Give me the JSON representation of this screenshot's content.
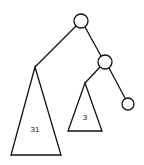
{
  "diagram": {
    "type": "binary-tree",
    "stroke_color": "#111111",
    "background": "#ffffff",
    "nodes": [
      {
        "id": "root",
        "cx": 81,
        "cy": 21,
        "r": 7
      },
      {
        "id": "right-child",
        "cx": 105,
        "cy": 62,
        "r": 7
      },
      {
        "id": "right-leaf",
        "cx": 128,
        "cy": 104,
        "r": 6
      }
    ],
    "subtrees": [
      {
        "id": "left-subtree",
        "apex": [
          35,
          67
        ],
        "base_left": [
          11,
          155
        ],
        "base_right": [
          61,
          155
        ],
        "label": "31",
        "label_x": 35,
        "label_y": 129
      },
      {
        "id": "inner-subtree",
        "apex": [
          85,
          83
        ],
        "base_left": [
          68,
          131
        ],
        "base_right": [
          102,
          131
        ],
        "label": "3",
        "label_x": 85,
        "label_y": 117
      }
    ],
    "edges": [
      {
        "from": "root",
        "to": "left-subtree"
      },
      {
        "from": "root",
        "to": "right-child"
      },
      {
        "from": "right-child",
        "to": "inner-subtree"
      },
      {
        "from": "right-child",
        "to": "right-leaf"
      }
    ]
  }
}
